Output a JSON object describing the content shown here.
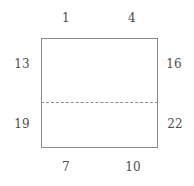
{
  "figure": {
    "type": "labeled-rectangle-diagram",
    "background_color": "#ffffff",
    "stroke_color": "#8a8a8a",
    "text_color": "#4d4d4d"
  },
  "shape": {
    "name": "rectangle",
    "divider": {
      "name": "horizontal-dashed-divider",
      "style": "dashed"
    }
  },
  "labels": {
    "top": {
      "left": "1",
      "right": "4"
    },
    "left": {
      "top": "13",
      "bottom": "19"
    },
    "right": {
      "top": "16",
      "bottom": "22"
    },
    "bottom": {
      "left": "7",
      "right": "10"
    }
  },
  "chart_data": {
    "type": "diagram",
    "title": "",
    "annotations": [
      {
        "text": "1",
        "position": "top-left"
      },
      {
        "text": "4",
        "position": "top-right"
      },
      {
        "text": "13",
        "position": "left-upper"
      },
      {
        "text": "16",
        "position": "right-upper"
      },
      {
        "text": "19",
        "position": "left-lower"
      },
      {
        "text": "22",
        "position": "right-lower"
      },
      {
        "text": "7",
        "position": "bottom-left"
      },
      {
        "text": "10",
        "position": "bottom-right"
      }
    ]
  }
}
